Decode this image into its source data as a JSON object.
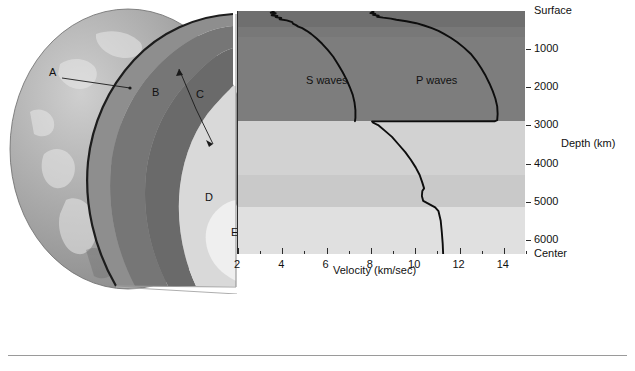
{
  "figure": {
    "title_visible": false
  },
  "diagram": {
    "layer_labels": [
      {
        "id": "A",
        "x": 49,
        "y": 73
      },
      {
        "id": "B",
        "x": 152,
        "y": 93
      },
      {
        "id": "C",
        "x": 196,
        "y": 95
      },
      {
        "id": "D",
        "x": 205,
        "y": 198
      },
      {
        "id": "E",
        "x": 231,
        "y": 233
      }
    ]
  },
  "chart_data": {
    "type": "line",
    "title": "",
    "xlabel": "Velocity (km/sec)",
    "ylabel": "Depth (km)",
    "xlim": [
      2,
      15
    ],
    "ylim": [
      0,
      6371
    ],
    "grid": false,
    "legend": "inline-annotation",
    "x_ticks": [
      2,
      4,
      6,
      8,
      10,
      12,
      14
    ],
    "x_tick_labels": [
      "2",
      "4",
      "6",
      "8",
      "10",
      "12",
      "14"
    ],
    "y_ticks": [
      0,
      1000,
      2000,
      3000,
      4000,
      5000,
      6000,
      6371
    ],
    "y_tick_labels": [
      "Surface",
      "1000",
      "2000",
      "3000",
      "4000",
      "5000",
      "6000",
      "Center"
    ],
    "series": [
      {
        "name": "S waves",
        "label_x": 306,
        "label_y": 74,
        "points": [
          [
            3.55,
            0
          ],
          [
            3.62,
            25
          ],
          [
            3.48,
            45
          ],
          [
            3.7,
            60
          ],
          [
            3.58,
            80
          ],
          [
            3.52,
            110
          ],
          [
            3.78,
            130
          ],
          [
            3.7,
            160
          ],
          [
            3.95,
            185
          ],
          [
            3.88,
            215
          ],
          [
            4.2,
            245
          ],
          [
            4.45,
            290
          ],
          [
            4.48,
            330
          ],
          [
            4.62,
            370
          ],
          [
            4.72,
            410
          ],
          [
            4.9,
            450
          ],
          [
            5.1,
            520
          ],
          [
            5.3,
            600
          ],
          [
            5.55,
            720
          ],
          [
            5.8,
            860
          ],
          [
            6.05,
            1020
          ],
          [
            6.3,
            1200
          ],
          [
            6.52,
            1400
          ],
          [
            6.72,
            1600
          ],
          [
            6.9,
            1800
          ],
          [
            7.05,
            2000
          ],
          [
            7.18,
            2200
          ],
          [
            7.26,
            2400
          ],
          [
            7.3,
            2600
          ],
          [
            7.3,
            2800
          ],
          [
            7.28,
            2890
          ]
        ]
      },
      {
        "name": "P waves",
        "label_x": 416,
        "label_y": 74,
        "points": [
          [
            8.05,
            0
          ],
          [
            8.12,
            30
          ],
          [
            7.98,
            55
          ],
          [
            8.2,
            75
          ],
          [
            8.1,
            100
          ],
          [
            8.35,
            125
          ],
          [
            8.28,
            150
          ],
          [
            8.55,
            175
          ],
          [
            8.9,
            200
          ],
          [
            9.15,
            230
          ],
          [
            9.6,
            270
          ],
          [
            10.05,
            320
          ],
          [
            10.4,
            380
          ],
          [
            10.75,
            450
          ],
          [
            11.05,
            520
          ],
          [
            11.3,
            600
          ],
          [
            11.6,
            700
          ],
          [
            11.9,
            820
          ],
          [
            12.2,
            960
          ],
          [
            12.5,
            1120
          ],
          [
            12.75,
            1300
          ],
          [
            12.98,
            1500
          ],
          [
            13.18,
            1700
          ],
          [
            13.35,
            1900
          ],
          [
            13.5,
            2100
          ],
          [
            13.62,
            2300
          ],
          [
            13.7,
            2500
          ],
          [
            13.72,
            2700
          ],
          [
            13.7,
            2860
          ],
          [
            13.6,
            2890
          ],
          [
            8.05,
            2895
          ],
          [
            8.1,
            2930
          ],
          [
            8.35,
            3000
          ],
          [
            8.65,
            3150
          ],
          [
            8.95,
            3300
          ],
          [
            9.25,
            3500
          ],
          [
            9.55,
            3700
          ],
          [
            9.8,
            3900
          ],
          [
            10.02,
            4100
          ],
          [
            10.2,
            4300
          ],
          [
            10.32,
            4500
          ],
          [
            10.4,
            4650
          ],
          [
            10.32,
            4720
          ],
          [
            10.3,
            4850
          ],
          [
            10.36,
            4980
          ],
          [
            10.9,
            5150
          ],
          [
            11.05,
            5250
          ],
          [
            11.15,
            5500
          ],
          [
            11.2,
            5800
          ],
          [
            11.24,
            6100
          ],
          [
            11.26,
            6371
          ]
        ]
      }
    ],
    "depth_bands": [
      {
        "name": "crust-upper-mantle",
        "from": 0,
        "to": 410,
        "color": "#6f6f6f"
      },
      {
        "name": "upper-mantle",
        "from": 410,
        "to": 670,
        "color": "#787878"
      },
      {
        "name": "lower-mantle",
        "from": 670,
        "to": 2890,
        "color": "#7d7d7d"
      },
      {
        "name": "outer-core-upper",
        "from": 2890,
        "to": 4300,
        "color": "#d2d2d2"
      },
      {
        "name": "outer-core-lower",
        "from": 4300,
        "to": 5150,
        "color": "#c9c9c9"
      },
      {
        "name": "inner-core",
        "from": 5150,
        "to": 6371,
        "color": "#e0e0e0"
      }
    ]
  }
}
